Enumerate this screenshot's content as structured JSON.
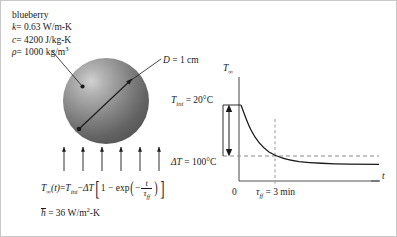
{
  "figure": {
    "background_color": "#ffffff",
    "border_color": "#c8c8c8"
  },
  "properties": {
    "material": "blueberry",
    "conductivity": {
      "symbol": "k",
      "equals": "= 0.63 W/m-K"
    },
    "specific_heat": {
      "symbol": "c",
      "equals": "= 4200 J/kg-K"
    },
    "density": {
      "symbol": "ρ",
      "equals": "= 1000 kg/m",
      "exponent": "3"
    }
  },
  "sphere": {
    "name": "blueberry-sphere",
    "diameter_label": "D = 1 cm",
    "diameter_symbol": "D",
    "diameter_value": "= 1 cm",
    "fill_light": "#d2d2d2",
    "fill_dark": "#565656"
  },
  "flow_arrows": {
    "count": 6,
    "direction": "up",
    "color": "#1a1a1a"
  },
  "equations": {
    "main": {
      "lhs_symbol": "T",
      "lhs_subscript": "∞",
      "lhs_arg": "(t)",
      "equals": "=",
      "rhs_t_ini_symbol": "T",
      "rhs_t_ini_subscript": "ini",
      "minus": "−",
      "delta_t": "ΔT",
      "bracket_open": "[",
      "one_minus": "1 − exp",
      "paren_open": "(",
      "frac_sign": "−",
      "frac_num": "t",
      "frac_den_symbol": "τ",
      "frac_den_subscript": "ff",
      "paren_close": ")",
      "bracket_close": "]"
    },
    "h_bar": {
      "symbol": "h",
      "equals": "= 36 W/m",
      "exponent": "2",
      "suffix": "-K"
    }
  },
  "chart_data": {
    "type": "line",
    "title": "",
    "xlabel": "t",
    "ylabel": "T∞",
    "ylabel_symbol": "T",
    "ylabel_subscript": "∞",
    "xlabel_symbol": "t",
    "x_tick_labels": [
      "0",
      "τff = 3 min"
    ],
    "x_tick_values": [
      0,
      3
    ],
    "y_annotations": [
      {
        "label": "T_ini = 20°C",
        "symbol": "T",
        "subscript": "ini",
        "text": "= 20°C",
        "value": 20,
        "unit": "°C"
      },
      {
        "label": "ΔT = 100°C",
        "symbol": "ΔT",
        "text": "= 100°C",
        "value": 100,
        "unit": "°C"
      }
    ],
    "x": [
      0,
      0.25,
      0.5,
      0.75,
      1,
      1.5,
      2,
      2.5,
      3,
      4,
      5,
      6,
      7,
      8,
      9,
      10,
      11,
      12
    ],
    "series": [
      {
        "name": "T_infinity(t)",
        "description": "T_inf(t) = T_ini - ΔT[1 - exp(-t/τff)]",
        "values": [
          20,
          -3.0,
          -21.5,
          -36.7,
          -48.3,
          -66.3,
          -78.6,
          -86.3,
          -91.6,
          -97.0,
          -98.9,
          -99.6,
          -99.85,
          -99.94,
          -99.98,
          -99.99,
          -100,
          -100
        ]
      }
    ],
    "asymptote": {
      "label": "T_ini − ΔT",
      "value": -80,
      "style": "dashed"
    },
    "time_constant": {
      "symbol": "τff",
      "value": 3,
      "unit": "min",
      "style": "dashed-vertical"
    },
    "grid": false,
    "legend": "none",
    "axis_color": "#555555",
    "curve_color": "#1a1a1a",
    "dash_color": "#808080"
  }
}
